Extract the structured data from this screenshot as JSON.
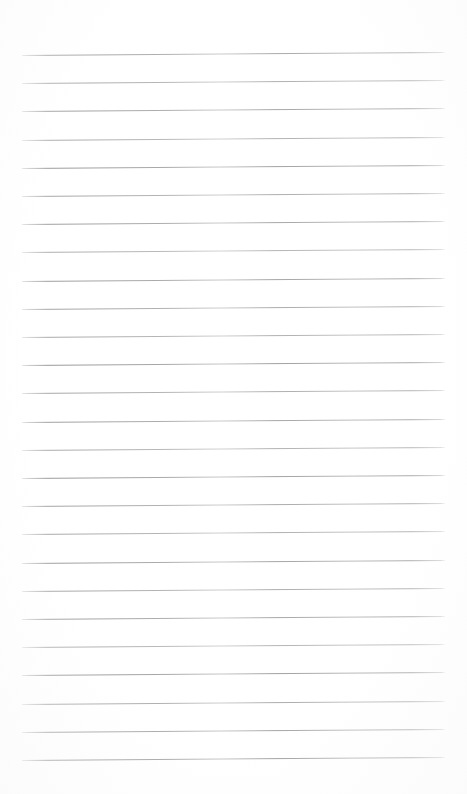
{
  "document": {
    "kind": "lined-paper-template",
    "title": "Lined Paper",
    "page_width": 467,
    "page_height": 794,
    "background_color": "#ffffff",
    "has_header_text": false,
    "has_margin_line": false,
    "body_text": ""
  },
  "ruling": {
    "line_count": 26,
    "line_spacing_px": 28.2,
    "first_line_y_px": 55,
    "last_line_y_px": 760,
    "line_left_x_px": 22,
    "line_right_x_px": 445,
    "line_length_px": 423,
    "line_thickness_px": 1,
    "line_color": "#8e8e8e",
    "line_color_light": "#b4b4b4",
    "skew_degrees": -0.42,
    "top_margin_px": 55,
    "bottom_margin_px": 34,
    "left_margin_px": 22,
    "right_margin_px": 22
  },
  "lines": [
    {
      "index": 1,
      "y": 55.0,
      "opacity": 0.78
    },
    {
      "index": 2,
      "y": 83.2,
      "opacity": 0.72
    },
    {
      "index": 3,
      "y": 111.4,
      "opacity": 0.8
    },
    {
      "index": 4,
      "y": 139.6,
      "opacity": 0.7
    },
    {
      "index": 5,
      "y": 167.8,
      "opacity": 0.84
    },
    {
      "index": 6,
      "y": 196.0,
      "opacity": 0.74
    },
    {
      "index": 7,
      "y": 224.2,
      "opacity": 0.8
    },
    {
      "index": 8,
      "y": 252.4,
      "opacity": 0.68
    },
    {
      "index": 9,
      "y": 280.6,
      "opacity": 0.82
    },
    {
      "index": 10,
      "y": 308.8,
      "opacity": 0.76
    },
    {
      "index": 11,
      "y": 337.0,
      "opacity": 0.72
    },
    {
      "index": 12,
      "y": 365.2,
      "opacity": 0.86
    },
    {
      "index": 13,
      "y": 393.4,
      "opacity": 0.74
    },
    {
      "index": 14,
      "y": 421.6,
      "opacity": 0.8
    },
    {
      "index": 15,
      "y": 449.8,
      "opacity": 0.7
    },
    {
      "index": 16,
      "y": 478.0,
      "opacity": 0.84
    },
    {
      "index": 17,
      "y": 506.2,
      "opacity": 0.76
    },
    {
      "index": 18,
      "y": 534.4,
      "opacity": 0.72
    },
    {
      "index": 19,
      "y": 562.6,
      "opacity": 0.82
    },
    {
      "index": 20,
      "y": 590.8,
      "opacity": 0.74
    },
    {
      "index": 21,
      "y": 619.0,
      "opacity": 0.8
    },
    {
      "index": 22,
      "y": 647.2,
      "opacity": 0.68
    },
    {
      "index": 23,
      "y": 675.4,
      "opacity": 0.86
    },
    {
      "index": 24,
      "y": 703.6,
      "opacity": 0.76
    },
    {
      "index": 25,
      "y": 731.8,
      "opacity": 0.82
    },
    {
      "index": 26,
      "y": 760.0,
      "opacity": 0.88
    }
  ]
}
